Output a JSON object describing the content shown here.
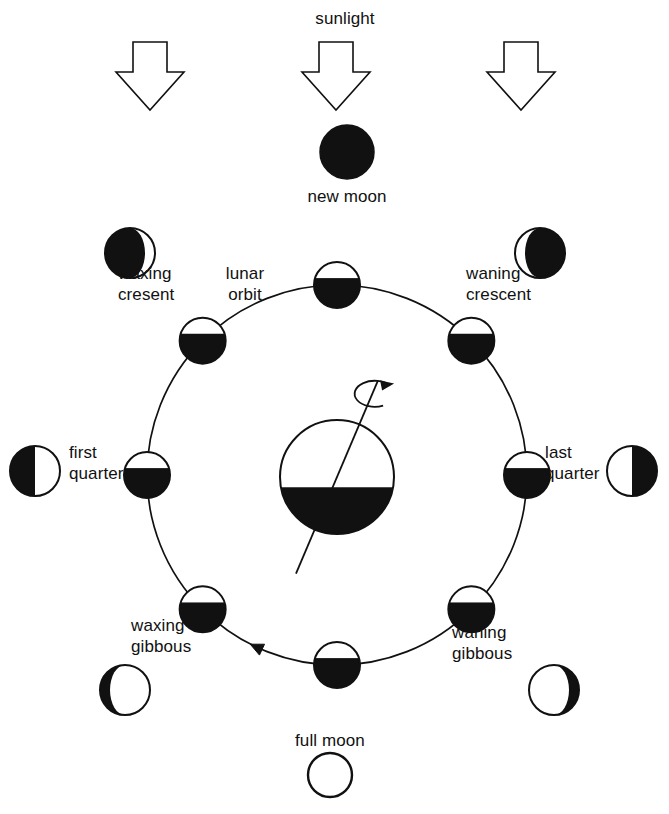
{
  "figure": {
    "background_color": "#ffffff",
    "ink_color": "#111111",
    "lit_color": "#ffffff",
    "dark_color": "#111111"
  },
  "sunlight": {
    "label": "sunlight",
    "arrow_count": 3,
    "direction": "down",
    "arrow_style": "hollow-outline",
    "arrow_x_positions": [
      150,
      336,
      521
    ],
    "arrow_top_y": 42,
    "arrow_bottom_y": 110
  },
  "orbit": {
    "label_line1": "lunar",
    "label_line2": "orbit",
    "label": "lunar orbit",
    "center_x": 337,
    "center_y": 475,
    "radius": 190,
    "direction": "counterclockwise",
    "arrowhead_angle_deg": 245
  },
  "earth": {
    "name": "earth",
    "center_x": 337,
    "center_y": 477,
    "radius": 57,
    "lit_side": "top",
    "rotation_arrow": "counterclockwise",
    "axis_tilt_deg": 23
  },
  "new_moon": {
    "label": "new moon",
    "fill": "full-dark",
    "cx": 347,
    "cy": 152,
    "r": 27,
    "label_x": 347,
    "label_y": 182
  },
  "full_moon": {
    "label": "full moon",
    "fill": "full-lit",
    "cx": 330,
    "cy": 775,
    "r": 22,
    "label_x": 330,
    "label_y": 735
  },
  "orbit_moons": [
    {
      "name": "orbit-moon-new",
      "angle_deg": 90,
      "r": 23,
      "lit": "top"
    },
    {
      "name": "orbit-moon-waxing-crescent",
      "angle_deg": 135,
      "r": 23,
      "lit": "top"
    },
    {
      "name": "orbit-moon-first-quarter",
      "angle_deg": 180,
      "r": 23,
      "lit": "top"
    },
    {
      "name": "orbit-moon-waxing-gibbous",
      "angle_deg": 225,
      "r": 23,
      "lit": "top"
    },
    {
      "name": "orbit-moon-full",
      "angle_deg": 270,
      "r": 23,
      "lit": "top"
    },
    {
      "name": "orbit-moon-waning-gibbous",
      "angle_deg": 315,
      "r": 23,
      "lit": "top"
    },
    {
      "name": "orbit-moon-last-quarter",
      "angle_deg": 0,
      "r": 23,
      "lit": "top"
    },
    {
      "name": "orbit-moon-waning-crescent",
      "angle_deg": 45,
      "r": 23,
      "lit": "top"
    }
  ],
  "phases": [
    {
      "key": "waxing_crescent",
      "label_line1": "waxing",
      "label_line2": "cresent",
      "label": "waxing cresent",
      "icon_name": "waxing-crescent-icon",
      "icon_cx": 130,
      "icon_cy": 253,
      "icon_r": 25,
      "lit_fraction": 0.2,
      "lit_side": "right",
      "label_x": 166,
      "label_y": 275
    },
    {
      "key": "first_quarter",
      "label_line1": "first",
      "label_line2": "quarter",
      "label": "first quarter",
      "icon_name": "first-quarter-icon",
      "icon_cx": 35,
      "icon_cy": 471,
      "icon_r": 25,
      "lit_fraction": 0.5,
      "lit_side": "right",
      "label_x": 104,
      "label_y": 449
    },
    {
      "key": "waxing_gibbous",
      "label_line1": "waxing",
      "label_line2": "gibbous",
      "label": "waxing gibbous",
      "icon_name": "waxing-gibbous-icon",
      "icon_cx": 125,
      "icon_cy": 690,
      "icon_r": 25,
      "lit_fraction": 0.8,
      "lit_side": "right",
      "label_x": 173,
      "label_y": 622
    },
    {
      "key": "full_moon_side",
      "label_line1": "full moon",
      "label_line2": "",
      "label": "full moon",
      "icon_name": "full-moon-icon",
      "icon_cx": 330,
      "icon_cy": 775,
      "icon_r": 22,
      "lit_fraction": 1.0,
      "lit_side": "all",
      "label_x": 330,
      "label_y": 735
    },
    {
      "key": "waning_gibbous",
      "label_line1": "waning",
      "label_line2": "gibbous",
      "label": "waning gibbous",
      "icon_name": "waning-gibbous-icon",
      "icon_cx": 554,
      "icon_cy": 690,
      "icon_r": 25,
      "lit_fraction": 0.8,
      "lit_side": "left",
      "label_x": 505,
      "label_y": 622
    },
    {
      "key": "last_quarter",
      "label_line1": "last",
      "label_line2": "quarter",
      "label": "last quarter",
      "icon_name": "last-quarter-icon",
      "icon_cx": 632,
      "icon_cy": 471,
      "icon_r": 25,
      "lit_fraction": 0.5,
      "lit_side": "left",
      "label_x": 565,
      "label_y": 449
    },
    {
      "key": "waning_crescent",
      "label_line1": "waning",
      "label_line2": "crescent",
      "label": "waning crescent",
      "icon_name": "waning-crescent-icon",
      "icon_cx": 540,
      "icon_cy": 253,
      "icon_r": 25,
      "lit_fraction": 0.2,
      "lit_side": "left",
      "label_x": 506,
      "label_y": 275
    },
    {
      "key": "new_moon_top",
      "label_line1": "new moon",
      "label_line2": "",
      "label": "new moon",
      "icon_name": "new-moon-icon",
      "icon_cx": 347,
      "icon_cy": 152,
      "icon_r": 27,
      "lit_fraction": 0.0,
      "lit_side": "none",
      "label_x": 347,
      "label_y": 182
    }
  ]
}
